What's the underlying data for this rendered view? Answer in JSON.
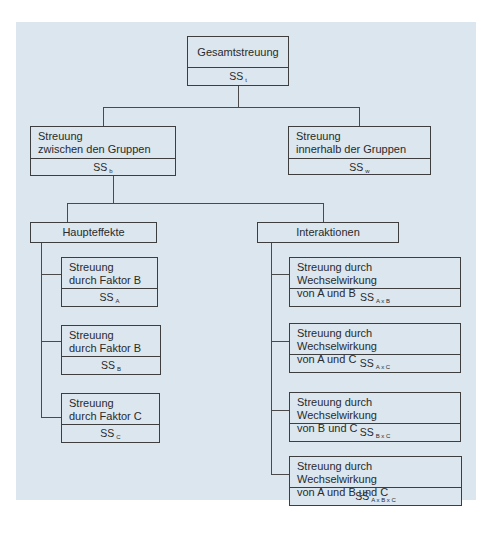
{
  "root": {
    "label": "Gesamtstreuung",
    "ss": "SS",
    "sub": "t"
  },
  "between": {
    "line1": "Streuung",
    "line2": "zwischen den Gruppen",
    "ss": "SS",
    "sub": "b"
  },
  "within": {
    "line1": "Streuung",
    "line2": "innerhalb der Gruppen",
    "ss": "SS",
    "sub": "w"
  },
  "main_effects": {
    "label": "Haupteffekte",
    "items": [
      {
        "line1": "Streuung",
        "line2": "durch Faktor B",
        "ss": "SS",
        "sub": "A"
      },
      {
        "line1": "Streuung",
        "line2": "durch Faktor B",
        "ss": "SS",
        "sub": "B"
      },
      {
        "line1": "Streuung",
        "line2": "durch Faktor C",
        "ss": "SS",
        "sub": "C"
      }
    ]
  },
  "interactions": {
    "label": "Interaktionen",
    "items": [
      {
        "line1": "Streuung durch Wechselwirkung",
        "line2": "von A und B",
        "ss": "SS",
        "sub": "A x B"
      },
      {
        "line1": "Streuung durch Wechselwirkung",
        "line2": "von A und C",
        "ss": "SS",
        "sub": "A x C"
      },
      {
        "line1": "Streuung durch Wechselwirkung",
        "line2": "von B und C",
        "ss": "SS",
        "sub": "B x C"
      },
      {
        "line1": "Streuung durch Wechselwirkung",
        "line2": "von A und B und C",
        "ss": "SS",
        "sub": "A x B x C"
      }
    ]
  }
}
